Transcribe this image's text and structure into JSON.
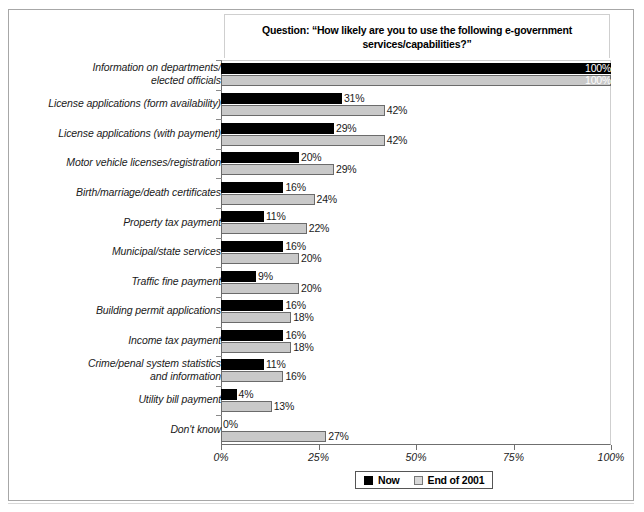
{
  "chart_data": {
    "type": "bar",
    "orientation": "horizontal",
    "title_line1": "Question:  “How likely are you to use the following e-government",
    "title_line2": "services/capabilities?”",
    "xlabel": "",
    "ylabel": "",
    "xlim": [
      0,
      100
    ],
    "grid": false,
    "legend_position": "bottom",
    "value_suffix": "%",
    "categories": [
      "Information on departments/ elected officials",
      "License applications (form availability)",
      "License applications (with payment)",
      "Motor vehicle licenses/registration",
      "Birth/marriage/death certificates",
      "Property tax payment",
      "Municipal/state services",
      "Traffic fine payment",
      "Building permit applications",
      "Income tax payment",
      "Crime/penal system statistics and information",
      "Utility bill payment",
      "Don't know"
    ],
    "category_lines": [
      [
        "Information on departments/",
        "elected officials"
      ],
      [
        "License applications (form availability)"
      ],
      [
        "License applications (with payment)"
      ],
      [
        "Motor vehicle licenses/registration"
      ],
      [
        "Birth/marriage/death certificates"
      ],
      [
        "Property tax payment"
      ],
      [
        "Municipal/state services"
      ],
      [
        "Traffic fine payment"
      ],
      [
        "Building permit applications"
      ],
      [
        "Income tax payment"
      ],
      [
        "Crime/penal system statistics",
        "and information"
      ],
      [
        "Utility bill payment"
      ],
      [
        "Don't know"
      ]
    ],
    "series": [
      {
        "name": "Now",
        "color": "#000000",
        "values": [
          100,
          31,
          29,
          20,
          16,
          11,
          16,
          9,
          16,
          16,
          11,
          4,
          0
        ],
        "labels": [
          "100%",
          "31%",
          "29%",
          "20%",
          "16%",
          "11%",
          "16%",
          "9%",
          "16%",
          "16%",
          "11%",
          "4%",
          "0%"
        ]
      },
      {
        "name": "End of 2001",
        "color": "#c9c9c9",
        "values": [
          100,
          42,
          42,
          29,
          24,
          22,
          20,
          20,
          18,
          18,
          16,
          13,
          27
        ],
        "labels": [
          "100%",
          "42%",
          "42%",
          "29%",
          "24%",
          "22%",
          "20%",
          "20%",
          "18%",
          "18%",
          "16%",
          "13%",
          "27%"
        ]
      }
    ],
    "xticks": [
      {
        "value": 0,
        "label": "0%"
      },
      {
        "value": 25,
        "label": "25%"
      },
      {
        "value": 50,
        "label": "50%"
      },
      {
        "value": 75,
        "label": "75%"
      },
      {
        "value": 100,
        "label": "100%"
      }
    ],
    "legend": [
      {
        "label": "Now",
        "swatch": "now"
      },
      {
        "label": "End of 2001",
        "swatch": "eoy"
      }
    ]
  }
}
